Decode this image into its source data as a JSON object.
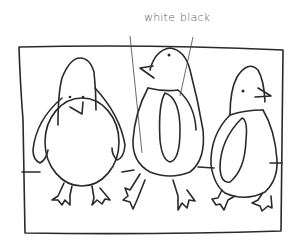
{
  "illustration": {
    "subject": "three penguins drawing",
    "labels": [
      {
        "id": "white",
        "text": "white"
      },
      {
        "id": "black",
        "text": "black"
      }
    ],
    "colors": {
      "ink": "#2a2a2a",
      "label_text": "#555555",
      "background": "#ffffff"
    }
  }
}
